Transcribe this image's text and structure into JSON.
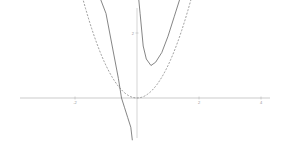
{
  "chart_data": {
    "type": "line",
    "title": "",
    "xlabel": "",
    "ylabel": "",
    "xlim": [
      -4.4,
      4.3
    ],
    "ylim": [
      -1.3,
      3.1
    ],
    "grid": false,
    "x_ticks": [
      -2,
      2,
      4
    ],
    "y_ticks": [
      2
    ],
    "x_tick_labels": [
      "-2",
      "2",
      "4"
    ],
    "y_tick_labels": [
      "2"
    ],
    "series": [
      {
        "name": "solid curve",
        "style": "solid",
        "color": "#666666",
        "description": "rational function with vertical asymptote at x=0; right branch minimum near (0.45, 1.0); left branch crosses x-axis near x=-0.5",
        "x": [
          -1.2,
          -1.0,
          -0.8,
          -0.6,
          -0.5,
          -0.4,
          -0.3,
          -0.2,
          -0.15,
          0.05,
          0.1,
          0.2,
          0.3,
          0.45,
          0.6,
          0.8,
          1.0,
          1.2,
          1.4
        ],
        "y": [
          3.1,
          2.6,
          1.6,
          0.6,
          0.0,
          -0.3,
          -0.6,
          -0.9,
          -1.3,
          3.1,
          2.6,
          1.6,
          1.2,
          1.0,
          1.1,
          1.4,
          1.9,
          2.5,
          3.1
        ]
      },
      {
        "name": "dashed curve",
        "style": "dashed",
        "color": "#888888",
        "description": "parabola y = x^2",
        "x": [
          -1.76,
          -1.5,
          -1.0,
          -0.5,
          0,
          0.5,
          1.0,
          1.5,
          1.76
        ],
        "y": [
          3.1,
          2.25,
          1.0,
          0.25,
          0,
          0.25,
          1.0,
          2.25,
          3.1
        ]
      }
    ]
  }
}
